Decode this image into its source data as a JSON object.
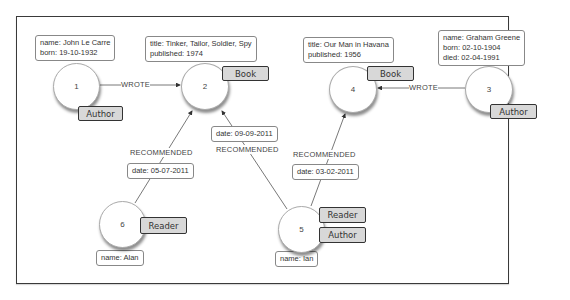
{
  "diagram": {
    "type": "graph",
    "nodes": [
      {
        "id": "1",
        "labels": [
          "Author"
        ],
        "properties": [
          "name: John Le Carre",
          "born: 19-10-1932"
        ]
      },
      {
        "id": "2",
        "labels": [
          "Book"
        ],
        "properties": [
          "title: Tinker, Tailor, Soldier, Spy",
          "published: 1974"
        ]
      },
      {
        "id": "3",
        "labels": [
          "Author"
        ],
        "properties": [
          "name: Graham Greene",
          "born: 02-10-1904",
          "died: 02-04-1991"
        ]
      },
      {
        "id": "4",
        "labels": [
          "Book"
        ],
        "properties": [
          "title: Our Man in Havana",
          "published: 1956"
        ]
      },
      {
        "id": "5",
        "labels": [
          "Reader",
          "Author"
        ],
        "properties": [
          "name: Ian"
        ]
      },
      {
        "id": "6",
        "labels": [
          "Reader"
        ],
        "properties": [
          "name: Alan"
        ]
      }
    ],
    "edges": [
      {
        "from": "1",
        "to": "2",
        "type": "WROTE"
      },
      {
        "from": "3",
        "to": "4",
        "type": "WROTE"
      },
      {
        "from": "6",
        "to": "2",
        "type": "RECOMMENDED",
        "properties": [
          "date: 05-07-2011"
        ]
      },
      {
        "from": "5",
        "to": "2",
        "type": "RECOMMENDED",
        "properties": [
          "date: 09-09-2011"
        ]
      },
      {
        "from": "5",
        "to": "4",
        "type": "RECOMMENDED",
        "properties": [
          "date: 03-02-2011"
        ]
      }
    ]
  },
  "colors": {
    "label_fill": "#d8d8d8",
    "frame": "#3a3a3a",
    "edge": "#555555"
  }
}
